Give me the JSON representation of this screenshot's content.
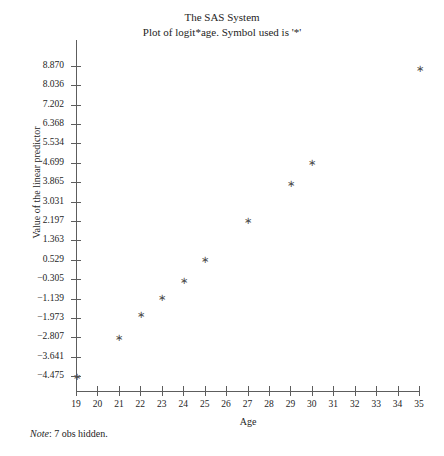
{
  "titles": {
    "line1": "The SAS System",
    "line2": "Plot of logit*age. Symbol used is '*'"
  },
  "footnote": {
    "label": "Note",
    "separator": ":",
    "text": " 7 obs hidden."
  },
  "colors": {
    "axis": "#5d5d5d",
    "text": "#242424",
    "marker": "#4a4a4a",
    "background": "#ffffff"
  },
  "chart_data": {
    "type": "scatter",
    "title": "The SAS System",
    "subtitle": "Plot of logit*age. Symbol used is '*'",
    "xlabel": "Age",
    "ylabel": "Value of the linear predictor",
    "marker": "*",
    "grid": false,
    "legend": "none",
    "xlim": [
      19,
      35
    ],
    "ylim": [
      -4.475,
      8.87
    ],
    "xticks": [
      19,
      20,
      21,
      22,
      23,
      24,
      25,
      26,
      27,
      28,
      29,
      30,
      31,
      32,
      33,
      34,
      35
    ],
    "xtick_labels": [
      "19",
      "20",
      "21",
      "22",
      "23",
      "24",
      "25",
      "26",
      "27",
      "28",
      "29",
      "30",
      "31",
      "32",
      "33",
      "34",
      "35"
    ],
    "yticks": [
      8.87,
      8.036,
      7.202,
      6.368,
      5.534,
      4.699,
      3.865,
      3.031,
      2.197,
      1.363,
      0.529,
      -0.305,
      -1.139,
      -1.973,
      -2.807,
      -3.641,
      -4.475
    ],
    "ytick_labels": [
      "8.870",
      "8.036",
      "7.202",
      "6.368",
      "5.534",
      "4.699",
      "3.865",
      "3.031",
      "2.197",
      "1.363",
      "0.529",
      "−0.305",
      "−1.139",
      "−1.973",
      "−2.807",
      "−3.641",
      "−4.475"
    ],
    "x": [
      19,
      21,
      22,
      23,
      24,
      25,
      27,
      29,
      30,
      35
    ],
    "y": [
      -4.475,
      -2.807,
      -1.84,
      -1.09,
      -0.36,
      0.54,
      2.24,
      3.82,
      4.72,
      8.78
    ],
    "points": [
      {
        "x": 19,
        "y": -4.475
      },
      {
        "x": 21,
        "y": -2.807
      },
      {
        "x": 22,
        "y": -1.84
      },
      {
        "x": 23,
        "y": -1.09
      },
      {
        "x": 24,
        "y": -0.36
      },
      {
        "x": 25,
        "y": 0.54
      },
      {
        "x": 27,
        "y": 2.24
      },
      {
        "x": 29,
        "y": 3.82
      },
      {
        "x": 30,
        "y": 4.72
      },
      {
        "x": 35,
        "y": 8.78
      }
    ],
    "annotations": [
      "Note: 7 obs hidden."
    ],
    "hidden_obs": 7
  }
}
